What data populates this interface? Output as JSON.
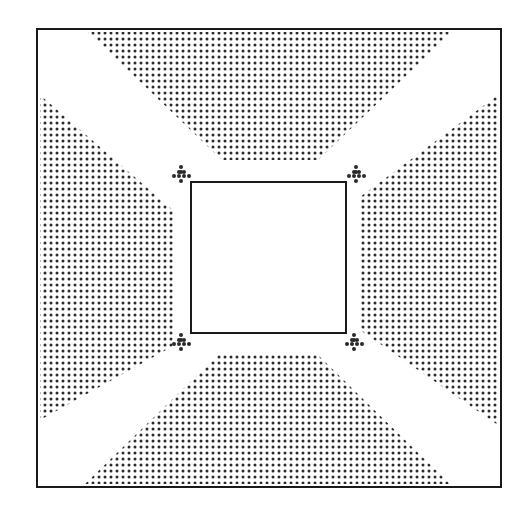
{
  "diagram": {
    "colors": {
      "background": "#ffffff",
      "line": "#1a1a1a",
      "dot": "#2a2a2a"
    },
    "outer_square": {
      "x1": 37,
      "y1": 29,
      "x2": 501,
      "y2": 487
    },
    "inner_square": {
      "x1": 191,
      "y1": 182,
      "x2": 346,
      "y2": 333
    },
    "dot_pitch": 6,
    "dot_radius": 1.5,
    "regions": [
      {
        "name": "top-stipple-region",
        "points": [
          [
            88,
            32
          ],
          [
            452,
            32
          ],
          [
            318,
            160
          ],
          [
            222,
            160
          ]
        ]
      },
      {
        "name": "left-stipple-region",
        "points": [
          [
            40,
            95
          ],
          [
            175,
            212
          ],
          [
            175,
            345
          ],
          [
            40,
            420
          ]
        ]
      },
      {
        "name": "right-stipple-region",
        "points": [
          [
            498,
            95
          ],
          [
            498,
            425
          ],
          [
            360,
            330
          ],
          [
            360,
            197
          ]
        ]
      },
      {
        "name": "bottom-stipple-region",
        "points": [
          [
            218,
            355
          ],
          [
            318,
            355
          ],
          [
            450,
            484
          ],
          [
            85,
            484
          ]
        ]
      }
    ],
    "markers": [
      {
        "name": "top-left-cross-marker",
        "cx": 181,
        "cy": 174
      },
      {
        "name": "top-right-cross-marker",
        "cx": 356,
        "cy": 174
      },
      {
        "name": "bottom-left-cross-marker",
        "cx": 181,
        "cy": 342
      },
      {
        "name": "bottom-right-cross-marker",
        "cx": 354,
        "cy": 342
      }
    ]
  }
}
